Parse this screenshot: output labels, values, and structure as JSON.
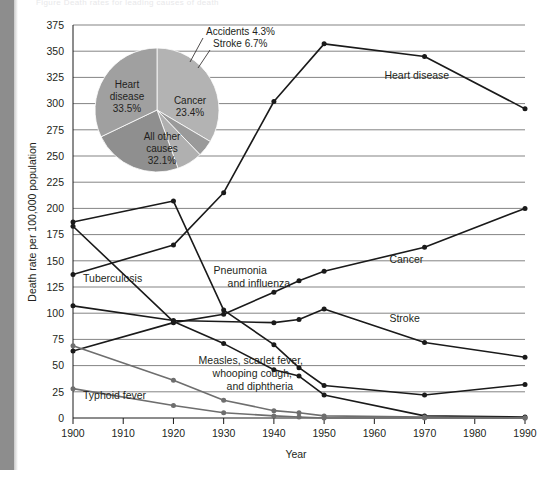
{
  "figure": {
    "caption_top": "Figure  Death rates for leading causes of death",
    "left_strip_color": "#8d8d8d"
  },
  "chart_data": {
    "type": "line",
    "title": "",
    "xlabel": "Year",
    "ylabel": "Death rate per 100,000 population",
    "xlim": [
      1900,
      1990
    ],
    "ylim": [
      0,
      375
    ],
    "ytick_step": 25,
    "grid": true,
    "legend_position": "inline-labels",
    "xticks": [
      1900,
      1910,
      1920,
      1930,
      1940,
      1950,
      1960,
      1970,
      1980,
      1990
    ],
    "ytick_labels": [
      "0",
      "25",
      "50",
      "75",
      "100",
      "125",
      "150",
      "175",
      "200",
      "225",
      "250",
      "275",
      "300",
      "325",
      "350",
      "375"
    ],
    "series": [
      {
        "name": "Heart disease",
        "color": "#1a1a1a",
        "label_x": 1962,
        "label_y": 323,
        "x": [
          1900,
          1920,
          1930,
          1940,
          1950,
          1970,
          1990
        ],
        "y": [
          137,
          165,
          215,
          302,
          357,
          345,
          295
        ]
      },
      {
        "name": "Cancer",
        "color": "#1a1a1a",
        "label_x": 1963,
        "label_y": 148,
        "x": [
          1900,
          1920,
          1930,
          1940,
          1945,
          1950,
          1970,
          1990
        ],
        "y": [
          64,
          91,
          99,
          120,
          131,
          140,
          163,
          200
        ]
      },
      {
        "name": "Stroke",
        "color": "#1a1a1a",
        "label_x": 1963,
        "label_y": 92,
        "x": [
          1900,
          1920,
          1940,
          1945,
          1950,
          1970,
          1990
        ],
        "y": [
          107,
          93,
          91,
          94,
          104,
          72,
          58
        ]
      },
      {
        "name": "Pneumonia and influenza",
        "color": "#1a1a1a",
        "label_x": 1928,
        "label_y": 137,
        "x": [
          1900,
          1920,
          1930,
          1940,
          1945,
          1950,
          1970,
          1990
        ],
        "y": [
          187,
          207,
          103,
          70,
          48,
          31,
          22,
          32
        ]
      },
      {
        "name": "Tuberculosis",
        "color": "#1a1a1a",
        "label_x": 1902,
        "label_y": 130,
        "x": [
          1900,
          1920,
          1930,
          1940,
          1945,
          1950,
          1970,
          1990
        ],
        "y": [
          183,
          92,
          71,
          46,
          40,
          22,
          2,
          1
        ]
      },
      {
        "name": "Measles, scarlet fever, whooping cough, and diphtheria",
        "color": "#6e6e6e",
        "label_x": 1925,
        "label_y": 52,
        "x": [
          1900,
          1920,
          1930,
          1940,
          1945,
          1950,
          1970,
          1990
        ],
        "y": [
          69,
          36,
          17,
          7,
          5,
          2,
          1,
          0
        ]
      },
      {
        "name": "Typhoid fever",
        "color": "#6e6e6e",
        "label_x": 1902,
        "label_y": 18,
        "x": [
          1900,
          1920,
          1930,
          1940,
          1945,
          1950,
          1970,
          1990
        ],
        "y": [
          28,
          12,
          5,
          2,
          1,
          0,
          0,
          0
        ]
      }
    ]
  },
  "pie_data": {
    "type": "pie",
    "title": "",
    "slices": [
      {
        "label": "Heart disease",
        "value": 33.5,
        "display": "Heart\ndisease\n33.5%",
        "color": "#b3b3b3",
        "callout": false
      },
      {
        "label": "Accidents",
        "value": 4.3,
        "display": "Accidents 4.3%",
        "color": "#9a9a9a",
        "callout": true
      },
      {
        "label": "Stroke",
        "value": 6.7,
        "display": "Stroke 6.7%",
        "color": "#b0b0b0",
        "callout": true
      },
      {
        "label": "Cancer",
        "value": 23.4,
        "display": "Cancer\n23.4%",
        "color": "#8f8f8f",
        "callout": false
      },
      {
        "label": "All other causes",
        "value": 32.1,
        "display": "All other\ncauses\n32.1%",
        "color": "#a0a0a0",
        "callout": false
      }
    ],
    "label_lines": {
      "heart": [
        "Heart",
        "disease",
        "33.5%"
      ],
      "cancer": [
        "Cancer",
        "23.4%"
      ],
      "other": [
        "All other",
        "causes",
        "32.1%"
      ],
      "accidents": "Accidents 4.3%",
      "stroke": "Stroke 6.7%"
    }
  }
}
